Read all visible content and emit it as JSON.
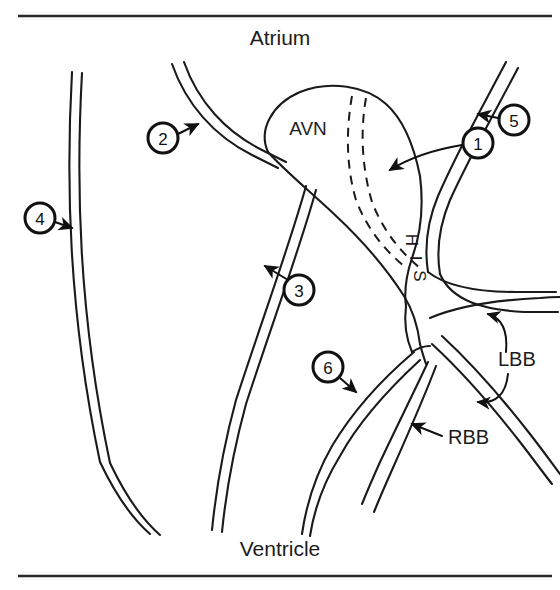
{
  "figure": {
    "ink_color": "#1a1a1a",
    "background_color": "#ffffff"
  },
  "chambers": {
    "top_label": "Atrium",
    "bottom_label": "Ventricle"
  },
  "structures": {
    "avn": "AVN",
    "his": "HIS",
    "his_letters": [
      "H",
      "I",
      "S"
    ],
    "rbb": "RBB",
    "lbb": "LBB"
  },
  "callouts": [
    {
      "id": "1",
      "number": "1",
      "name": "callout-1"
    },
    {
      "id": "2",
      "number": "2",
      "name": "callout-2"
    },
    {
      "id": "3",
      "number": "3",
      "name": "callout-3"
    },
    {
      "id": "4",
      "number": "4",
      "name": "callout-4"
    },
    {
      "id": "5",
      "number": "5",
      "name": "callout-5"
    },
    {
      "id": "6",
      "number": "6",
      "name": "callout-6"
    }
  ]
}
